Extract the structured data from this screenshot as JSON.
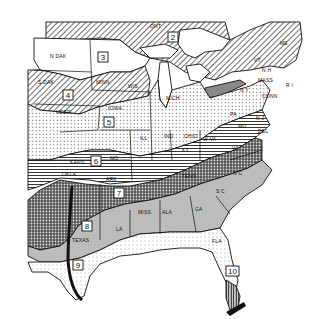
{
  "map": {
    "title": "",
    "region": "Eastern United States",
    "zones": [
      {
        "id": "2",
        "label": "2",
        "pattern": "diagonal-hatch"
      },
      {
        "id": "3",
        "label": "3",
        "pattern": "blank"
      },
      {
        "id": "4",
        "label": "4",
        "pattern": "diagonal-hatch"
      },
      {
        "id": "5",
        "label": "5",
        "pattern": "dotted"
      },
      {
        "id": "6",
        "label": "6",
        "pattern": "dotted"
      },
      {
        "id": "7",
        "label": "7",
        "pattern": "crosshatch-dark"
      },
      {
        "id": "8",
        "label": "8",
        "pattern": "gray-shade"
      },
      {
        "id": "9",
        "label": "9",
        "pattern": "light-dotted"
      },
      {
        "id": "10",
        "label": "10",
        "pattern": "vertical-hatch"
      }
    ],
    "state_labels": {
      "n_dak": "N DAK",
      "s_dak": "S DAK",
      "nebr": "NEBR",
      "minn": "MINN",
      "wis": "WIS",
      "iowa": "IOWA",
      "kans": "KANS",
      "mo": "MO",
      "okla": "OKLA",
      "ark": "ARK",
      "texas": "TEXAS",
      "la": "LA",
      "miss": "MISS",
      "ala": "ALA",
      "ga": "GA",
      "fla": "FLA",
      "sc": "S C",
      "nc": "N C",
      "tenn": "TENN",
      "ky": "KY",
      "va": "VA",
      "wva": "W VA",
      "ill": "ILL",
      "ind": "IND",
      "ohio": "OHIO",
      "mich": "MICH",
      "pa": "PA",
      "ny": "N Y",
      "nj": "N J",
      "del": "DEL",
      "md": "MD",
      "conn": "CONN",
      "ri": "R I",
      "mass": "MASS",
      "nh": "N H",
      "vt": "VT",
      "me": "ME",
      "ont": "ONT"
    },
    "colors": {
      "ink": "#111111",
      "paper": "#ffffff",
      "gray_zone": "#b8b8b8",
      "dark_gray": "#7a7a7a"
    }
  }
}
